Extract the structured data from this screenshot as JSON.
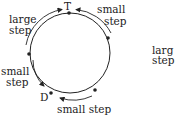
{
  "diagram": {
    "labels": {
      "top_node": "T",
      "bottom_node": "D",
      "top_left": [
        "large",
        "step"
      ],
      "top_right": [
        "small",
        "step"
      ],
      "left": [
        "small",
        "step"
      ],
      "bottom": "small step",
      "right_cut": [
        "larg",
        "step"
      ]
    },
    "colors": {
      "stroke": "#222222",
      "background": "#ffffff"
    }
  }
}
